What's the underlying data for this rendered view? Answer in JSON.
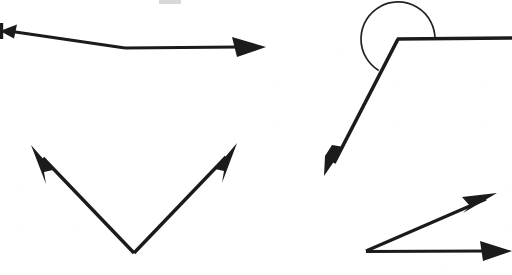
{
  "page": {
    "width": 512,
    "height": 275,
    "background_color": "#ffffff",
    "ink_color": "#1b1b1b"
  },
  "figures": [
    {
      "id": "figure-top-left",
      "name": "bent-double-arrow",
      "label": "Bent line with arrowheads at both ends",
      "vertex": {
        "x": 125,
        "y": 48
      },
      "rays": [
        {
          "name": "ray-left",
          "end": {
            "x": 2,
            "y": 31
          },
          "arrowhead": "left",
          "clipped": true
        },
        {
          "name": "ray-right",
          "end": {
            "x": 266,
            "y": 47
          },
          "arrowhead": "right",
          "clipped": false
        }
      ]
    },
    {
      "id": "figure-bottom-left",
      "name": "v-double-arrow",
      "label": "V-shaped angle opening upward with arrowheads on both rays",
      "vertex": {
        "x": 134,
        "y": 253
      },
      "rays": [
        {
          "name": "ray-up-left",
          "end": {
            "x": 31,
            "y": 146
          },
          "arrowhead": "up-left",
          "clipped": false
        },
        {
          "name": "ray-up-right",
          "end": {
            "x": 237,
            "y": 144
          },
          "arrowhead": "up-right",
          "clipped": false
        }
      ]
    },
    {
      "id": "figure-top-right",
      "name": "reflex-angle-with-arc",
      "label": "Angle with arc marking the reflex region",
      "vertex": {
        "x": 398,
        "y": 39
      },
      "arc": {
        "name": "reflex-angle-arc",
        "center": {
          "x": 398,
          "y": 39
        },
        "radius": 37,
        "sweep": "counterclockwise from horizontal-right ray around to down-left ray"
      },
      "rays": [
        {
          "name": "ray-right-horizontal",
          "end": {
            "x": 512,
            "y": 39
          },
          "arrowhead": "none",
          "clipped": true
        },
        {
          "name": "ray-down-left",
          "end": {
            "x": 324,
            "y": 176
          },
          "arrowhead": "down-left",
          "clipped": false
        }
      ]
    },
    {
      "id": "figure-bottom-right",
      "name": "narrow-angle-double-arrow",
      "label": "Narrow acute angle with arrowheads on both rays",
      "vertex": {
        "x": 366,
        "y": 251
      },
      "rays": [
        {
          "name": "ray-upper-right",
          "end": {
            "x": 497,
            "y": 193
          },
          "arrowhead": "up-right",
          "clipped": false
        },
        {
          "name": "ray-right-horizontal",
          "end": {
            "x": 512,
            "y": 251
          },
          "arrowhead": "right",
          "clipped": true
        }
      ]
    }
  ],
  "artifacts": [
    {
      "id": "top-smudge",
      "name": "cut-off-mark",
      "label": "Faint cut-off mark at top edge",
      "x": 159,
      "y": 0,
      "width": 22,
      "height": 4
    }
  ]
}
